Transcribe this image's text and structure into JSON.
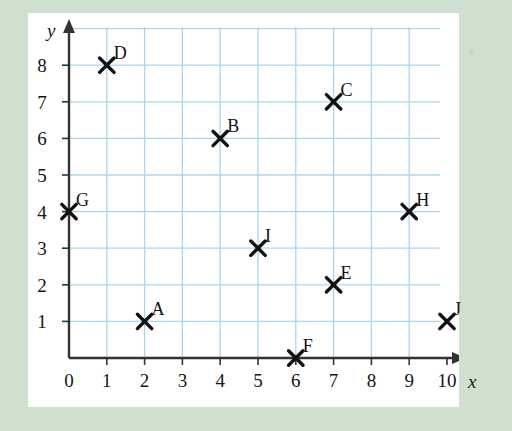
{
  "page": {
    "background_color": "#cfe0cf",
    "panel_color": "#ffffff"
  },
  "chart_data": {
    "type": "scatter",
    "title": "",
    "subtitle": "",
    "xlabel": "x",
    "ylabel": "y",
    "xlim": [
      0,
      10.6
    ],
    "ylim": [
      0,
      9.0
    ],
    "xticks": [
      "0",
      "1",
      "2",
      "3",
      "4",
      "5",
      "6",
      "7",
      "8",
      "9",
      "10"
    ],
    "yticks": [
      "1",
      "2",
      "3",
      "4",
      "5",
      "6",
      "7",
      "8"
    ],
    "grid": true,
    "grid_color": "#a8d8ec",
    "axis_color": "#333333",
    "marker_color": "#111111",
    "marker_style": "x",
    "legend": "none",
    "points": [
      {
        "label": "A",
        "x": 2,
        "y": 1
      },
      {
        "label": "B",
        "x": 4,
        "y": 6
      },
      {
        "label": "C",
        "x": 7,
        "y": 7
      },
      {
        "label": "D",
        "x": 1,
        "y": 8
      },
      {
        "label": "E",
        "x": 7,
        "y": 2
      },
      {
        "label": "F",
        "x": 6,
        "y": 0
      },
      {
        "label": "G",
        "x": 0,
        "y": 4
      },
      {
        "label": "H",
        "x": 9,
        "y": 4
      },
      {
        "label": "I",
        "x": 5,
        "y": 3
      },
      {
        "label": "J",
        "x": 10,
        "y": 1
      }
    ]
  },
  "geometry": {
    "origin_x": 41,
    "origin_y": 345,
    "unit_x": 37.8,
    "unit_y": 36.6,
    "grid_top": 14,
    "grid_right": 412,
    "grid_left": 41,
    "label_offset_x": 7,
    "label_offset_y": -11
  }
}
